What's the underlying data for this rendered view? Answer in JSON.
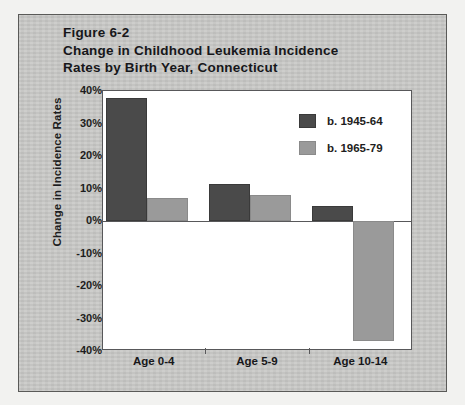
{
  "figure": {
    "title_lines": [
      "Figure 6-2",
      "Change in Childhood Leukemia Incidence",
      "Rates by Birth Year, Connecticut"
    ]
  },
  "chart_data": {
    "type": "bar",
    "title": "Figure 6-2 Change in Childhood Leukemia Incidence Rates by Birth Year, Connecticut",
    "xlabel": "",
    "ylabel": "Change in Incidence Rates",
    "categories": [
      "Age 0-4",
      "Age 5-9",
      "Age 10-14"
    ],
    "series": [
      {
        "name": "b. 1945-64",
        "color": "#4a4a4a",
        "values": [
          38,
          11.5,
          4.5
        ]
      },
      {
        "name": "b. 1965-79",
        "color": "#9a9a9a",
        "values": [
          7,
          8,
          -37
        ]
      }
    ],
    "ylim": [
      -40,
      40
    ],
    "ytick_labels": [
      "40%",
      "30%",
      "20%",
      "10%",
      "0%",
      "-10%",
      "-20%",
      "-30%",
      "-40%"
    ],
    "ytick_values": [
      40,
      30,
      20,
      10,
      0,
      -10,
      -20,
      -30,
      -40
    ],
    "grid": false,
    "legend_position": "top-right",
    "value_suffix": "%"
  },
  "legend": {
    "entries": [
      {
        "label": "b. 1945-64",
        "color": "#4a4a4a"
      },
      {
        "label": "b. 1965-79",
        "color": "#9a9a9a"
      }
    ]
  },
  "colors": {
    "series_dark": "#4a4a4a",
    "series_light": "#9a9a9a",
    "page_background": "#c9c9c7",
    "plot_background": "#ffffff",
    "axis": "#58585a",
    "text": "#17171a"
  }
}
